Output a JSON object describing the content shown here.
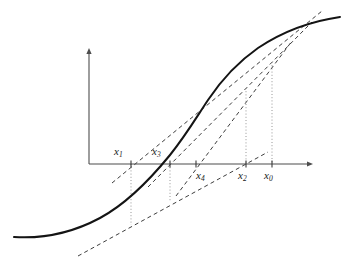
{
  "figure": {
    "width": 349,
    "height": 263,
    "background_color": "#ffffff"
  },
  "axes": {
    "x_axis": {
      "name": "horizontal-axis",
      "y_pixel": 164,
      "x_start": 89,
      "x_end": 313,
      "arrow": "right",
      "color": "#4d4d4d"
    },
    "y_axis": {
      "name": "vertical-axis",
      "x_pixel": 89,
      "y_start": 164,
      "y_end": 48,
      "arrow": "up",
      "color": "#4d4d4d"
    }
  },
  "ticks": [
    {
      "id": "x1",
      "label": "x",
      "sub": "1",
      "x": 131,
      "label_side": "above",
      "label_x": 114,
      "label_y": 146
    },
    {
      "id": "x3",
      "label": "x",
      "sub": "3",
      "x": 170,
      "label_side": "above",
      "label_x": 152,
      "label_y": 146
    },
    {
      "id": "x4",
      "label": "x",
      "sub": "4",
      "x": 196,
      "label_side": "below",
      "label_x": 196,
      "label_y": 170
    },
    {
      "id": "x2",
      "label": "x",
      "sub": "2",
      "x": 246,
      "label_side": "below",
      "label_x": 238,
      "label_y": 170
    },
    {
      "id": "x0",
      "label": "x",
      "sub": "0",
      "x": 272,
      "label_side": "below",
      "label_x": 264,
      "label_y": 170
    }
  ],
  "curve": {
    "name": "function-curve",
    "description": "monotone increasing sigmoid shaped function f(x)",
    "color": "#141414",
    "stroke_width": 2.0,
    "path": "M 14 237 C 45 239 72 233 100 218 C 126 204 148 182 170 155 C 186 135 196 118 208 100 C 222 79 238 62 258 48 C 282 32 312 21 340 17"
  },
  "secants": [
    {
      "id": "secant-x0-x1",
      "name": "secant-line-through-x1",
      "description": "dashed secant crossing the axis at x1",
      "x1": 112,
      "y1": 183,
      "x2": 322,
      "y2": 11
    },
    {
      "id": "secant-x3",
      "name": "secant-line-through-x3",
      "description": "dashed secant crossing the axis at x3",
      "x1": 148,
      "y1": 187,
      "x2": 312,
      "y2": 22
    },
    {
      "id": "secant-x4",
      "name": "secant-line-through-x4",
      "description": "dashed secant crossing the axis at x4",
      "x1": 176,
      "y1": 196,
      "x2": 292,
      "y2": 41
    },
    {
      "id": "secant-x2",
      "name": "secant-line-through-x2",
      "description": "dashed secant crossing the axis at x2 with shallow slope",
      "x1": 78,
      "y1": 256,
      "x2": 268,
      "y2": 152
    }
  ],
  "drop_lines": [
    {
      "id": "drop-x1",
      "name": "dotted-drop-line-x1",
      "x": 131,
      "y_top": 164,
      "y_bottom": 225
    },
    {
      "id": "drop-x3",
      "name": "dotted-drop-line-x3",
      "x": 170,
      "y_top": 164,
      "y_bottom": 202
    },
    {
      "id": "drop-x2",
      "name": "dotted-drop-line-x2",
      "x": 246,
      "y_top": 88,
      "y_bottom": 164
    },
    {
      "id": "drop-x0",
      "name": "dotted-drop-line-x0",
      "x": 272,
      "y_top": 62,
      "y_bottom": 164
    }
  ],
  "colors": {
    "curve": "#141414",
    "axis": "#4d4d4d",
    "secant": "#3d3d3d",
    "drop_line": "#8a8a8a",
    "label": "#1a1a1a"
  },
  "chart_data": {
    "type": "line",
    "title": "",
    "xlabel": "",
    "ylabel": "",
    "grid": false,
    "legend": null,
    "series": [
      {
        "name": "f(x) sigmoid curve",
        "x": [
          14,
          40,
          66,
          92,
          118,
          144,
          170,
          196,
          222,
          248,
          274,
          300,
          326,
          340
        ],
        "y": [
          237,
          238,
          235,
          227,
          212,
          186,
          155,
          124,
          95,
          70,
          50,
          35,
          23,
          17
        ]
      }
    ],
    "annotations": [
      {
        "text": "x0",
        "x": 272,
        "y": 164,
        "role": "iterate-initial"
      },
      {
        "text": "x1",
        "x": 131,
        "y": 164,
        "role": "iterate-1"
      },
      {
        "text": "x2",
        "x": 246,
        "y": 164,
        "role": "iterate-2"
      },
      {
        "text": "x3",
        "x": 170,
        "y": 164,
        "role": "iterate-3"
      },
      {
        "text": "x4",
        "x": 196,
        "y": 164,
        "role": "iterate-4"
      }
    ],
    "xlim": [
      0,
      349
    ],
    "ylim": [
      263,
      0
    ]
  }
}
